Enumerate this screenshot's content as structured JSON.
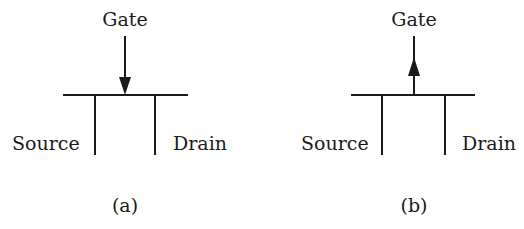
{
  "figure": {
    "panels": [
      {
        "id": "a",
        "caption": "(a)",
        "gate_label": "Gate",
        "source_label": "Source",
        "drain_label": "Drain",
        "arrow_direction": "down",
        "geometry": {
          "cx": 125,
          "bar_x1": 63,
          "bar_x2": 188,
          "bar_y": 95,
          "src_x": 95,
          "drn_x": 155,
          "leg_y2": 155,
          "gate_y1": 36
        }
      },
      {
        "id": "b",
        "caption": "(b)",
        "gate_label": "Gate",
        "source_label": "Source",
        "drain_label": "Drain",
        "arrow_direction": "up",
        "geometry": {
          "cx": 414,
          "bar_x1": 351,
          "bar_x2": 475,
          "bar_y": 95,
          "src_x": 382,
          "drn_x": 445,
          "leg_y2": 155,
          "gate_y1": 36
        }
      }
    ],
    "colors": {
      "ink": "#1a1a1a",
      "background": "#ffffff"
    }
  }
}
